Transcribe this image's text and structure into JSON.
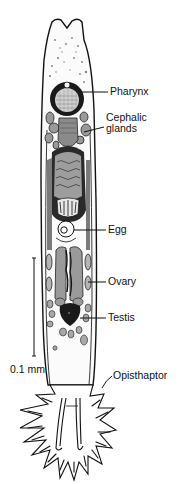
{
  "figure": {
    "labels": {
      "pharynx": "Pharynx",
      "cephalic_glands_line1": "Cephalic",
      "cephalic_glands_line2": "glands",
      "egg": "Egg",
      "ovary": "Ovary",
      "testis": "Testis",
      "opisthaptor": "Opisthaptor"
    },
    "scale_bar": {
      "label": "0.1 mm"
    },
    "colors": {
      "ink": "#111111",
      "tissue": "#9a9a9a",
      "light_tissue": "#c8c8c8",
      "background": "#ffffff"
    }
  }
}
